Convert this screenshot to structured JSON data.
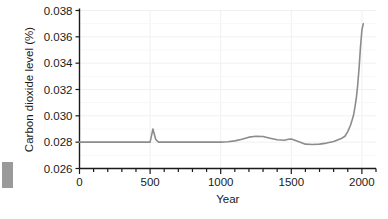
{
  "chart_data": {
    "type": "line",
    "title": "",
    "xlabel": "Year",
    "ylabel": "Carbon dioxide level (%)",
    "xlim": [
      0,
      2100
    ],
    "ylim": [
      0.026,
      0.038
    ],
    "xticks": [
      0,
      500,
      1000,
      1500,
      2000
    ],
    "xtick_labels": [
      "0",
      "500",
      "1000",
      "1500",
      "2000"
    ],
    "xminor_tick_step": 100,
    "yticks": [
      0.026,
      0.028,
      0.03,
      0.032,
      0.034,
      0.036,
      0.038
    ],
    "ytick_labels": [
      "0.026",
      "0.028",
      "0.030",
      "0.032",
      "0.034",
      "0.036",
      "0.038"
    ],
    "grid": "faint",
    "legend": "none",
    "line_color": "#8c8c8c",
    "axis_color": "#1a1a1a",
    "series": [
      {
        "name": "Carbon dioxide level",
        "x": [
          0,
          100,
          200,
          300,
          400,
          480,
          500,
          520,
          540,
          560,
          600,
          700,
          800,
          900,
          1000,
          1050,
          1100,
          1150,
          1200,
          1250,
          1300,
          1350,
          1400,
          1450,
          1480,
          1500,
          1550,
          1600,
          1650,
          1700,
          1750,
          1800,
          1850,
          1880,
          1900,
          1920,
          1940,
          1950,
          1960,
          1970,
          1980,
          1990,
          2000,
          2010
        ],
        "y": [
          0.028,
          0.028,
          0.028,
          0.028,
          0.028,
          0.028,
          0.028,
          0.029,
          0.0282,
          0.028,
          0.028,
          0.028,
          0.028,
          0.028,
          0.028,
          0.02803,
          0.0281,
          0.02822,
          0.02838,
          0.02845,
          0.02843,
          0.0283,
          0.02818,
          0.02815,
          0.02822,
          0.02824,
          0.02805,
          0.02785,
          0.02782,
          0.02785,
          0.02793,
          0.02805,
          0.02825,
          0.02845,
          0.0288,
          0.0293,
          0.03,
          0.0306,
          0.0313,
          0.0323,
          0.0336,
          0.0352,
          0.0365,
          0.037
        ]
      }
    ]
  },
  "edge_marker": {
    "label": "page-edge-marker"
  }
}
